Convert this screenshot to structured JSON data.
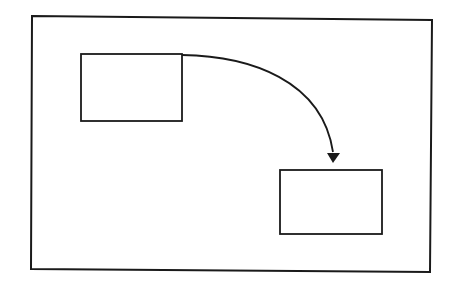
{
  "diagram": {
    "background": "#ffffff",
    "stroke_color": "#1a1a1a",
    "frame": {
      "points": [
        [
          32,
          16
        ],
        [
          432,
          20
        ],
        [
          430,
          272
        ],
        [
          31,
          269
        ]
      ],
      "stroke_width": 2
    },
    "boxes": [
      {
        "id": "source-box",
        "x": 81,
        "y": 54,
        "width": 101,
        "height": 67,
        "label": ""
      },
      {
        "id": "target-box",
        "x": 280,
        "y": 170,
        "width": 102,
        "height": 64,
        "label": ""
      }
    ],
    "arrow": {
      "from": "source-box",
      "to": "target-box",
      "path": "M 182 55 C 250 56, 322 80, 333 152",
      "head": {
        "tip": [
          333,
          163
        ],
        "base_left": [
          327,
          153
        ],
        "base_right": [
          340,
          153
        ]
      },
      "stroke_width": 1.8
    }
  }
}
